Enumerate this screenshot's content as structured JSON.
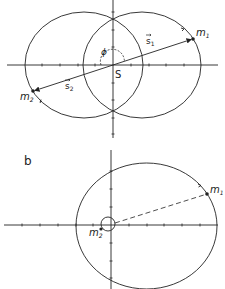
{
  "figure_a": {
    "label_s1": "s",
    "label_s1_sub": "1",
    "label_s2": "s",
    "label_s2_sub": "2",
    "label_m1": "m",
    "label_m1_sub": "1",
    "label_m2": "m",
    "label_m2_sub": "2",
    "label_phi": "ϕ",
    "label_center": "S"
  },
  "figure_b": {
    "panel_label": "b",
    "label_m1": "m",
    "label_m1_sub": "1",
    "label_m2": "m",
    "label_m2_sub": "2"
  },
  "colors": {
    "stroke": "#222222",
    "background": "#ffffff"
  }
}
